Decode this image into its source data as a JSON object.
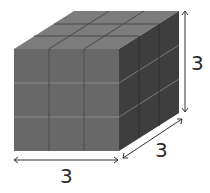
{
  "figure": {
    "labels": {
      "width": "3",
      "depth": "3",
      "height": "3"
    },
    "colors": {
      "front": "#686868",
      "top": "#7c7c7c",
      "side": "#3e3e3e",
      "grid_front": "#8a8a8a",
      "grid_side": "#777777",
      "grid_top": "#4a4a4a",
      "arrow": "#333333"
    }
  }
}
